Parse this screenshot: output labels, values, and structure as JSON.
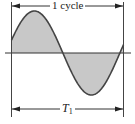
{
  "diagram": {
    "type": "sine-wave-period",
    "labels": {
      "cycle": "1 cycle",
      "period_symbol": "T",
      "period_subscript": "1"
    },
    "colors": {
      "line": "#444444",
      "fill": "#c8c8c8",
      "background": "#ffffff"
    },
    "wave": {
      "cycles_shown": 1,
      "fill_between_wave_and_axis": true
    }
  }
}
